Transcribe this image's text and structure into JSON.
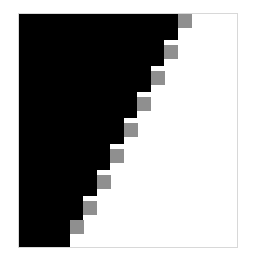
{
  "figure": {
    "title": "",
    "background_color": "#ffffff",
    "width": 253,
    "height": 262
  },
  "axes": {
    "frame_color": "#d8d8d8",
    "frame_left": 18,
    "frame_top": 13,
    "frame_width": 220,
    "frame_height": 235,
    "xlabel": "",
    "ylabel": "",
    "xticklabels": [],
    "yticklabels": [],
    "grid": false,
    "legend": ""
  },
  "colors": {
    "black": "#000000",
    "white": "#ffffff",
    "gray": "#8f8f8f"
  },
  "chart_data": {
    "type": "heatmap",
    "title": "",
    "xlabel": "",
    "ylabel": "",
    "grid": false,
    "legend": "",
    "colormap": [
      "#000000",
      "#8f8f8f",
      "#ffffff"
    ],
    "value_levels": [
      0,
      0.44,
      1
    ],
    "n_steps": 8,
    "step_width": 13.2,
    "step_height": 25.8,
    "xlim": [
      0,
      8
    ],
    "ylim": [
      0,
      8
    ],
    "steps": [
      {
        "index": 0,
        "black_width": 159,
        "top": 0,
        "height": 26,
        "gray_x": 159,
        "gray_y": 0,
        "gray_w": 14,
        "gray_h": 14
      },
      {
        "index": 1,
        "black_width": 145,
        "top": 26,
        "height": 26,
        "gray_x": 145,
        "gray_y": 31,
        "gray_w": 14,
        "gray_h": 14
      },
      {
        "index": 2,
        "black_width": 132,
        "top": 52,
        "height": 26,
        "gray_x": 132,
        "gray_y": 57,
        "gray_w": 14,
        "gray_h": 14
      },
      {
        "index": 3,
        "black_width": 118,
        "top": 78,
        "height": 26,
        "gray_x": 118,
        "gray_y": 83,
        "gray_w": 14,
        "gray_h": 14
      },
      {
        "index": 4,
        "black_width": 105,
        "top": 104,
        "height": 26,
        "gray_x": 105,
        "gray_y": 109,
        "gray_w": 14,
        "gray_h": 14
      },
      {
        "index": 5,
        "black_width": 91,
        "top": 130,
        "height": 26,
        "gray_x": 91,
        "gray_y": 135,
        "gray_w": 14,
        "gray_h": 14
      },
      {
        "index": 6,
        "black_width": 78,
        "top": 156,
        "height": 26,
        "gray_x": 78,
        "gray_y": 161,
        "gray_w": 14,
        "gray_h": 14
      },
      {
        "index": 7,
        "black_width": 64,
        "top": 182,
        "height": 26,
        "gray_x": 64,
        "gray_y": 187,
        "gray_w": 14,
        "gray_h": 14
      },
      {
        "index": 8,
        "black_width": 51,
        "top": 208,
        "height": 27,
        "gray_x": 51,
        "gray_y": 206,
        "gray_w": 14,
        "gray_h": 14
      }
    ]
  }
}
